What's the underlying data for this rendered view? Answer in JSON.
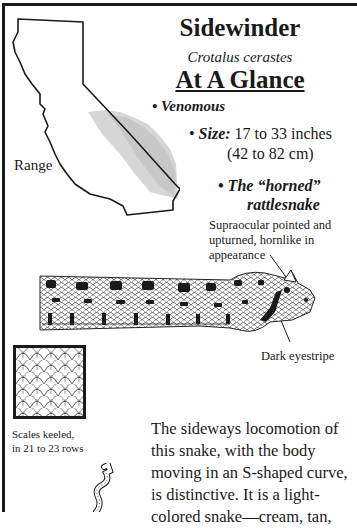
{
  "header": {
    "title": "Sidewinder",
    "scientific_name": "Crotalus cerastes",
    "section_title": "At A Glance"
  },
  "facts": {
    "venomous": "• Venomous",
    "size_bullet": "• ",
    "size_label": "Size:",
    "size_inches": " 17 to 33 inches",
    "size_cm": "(42 to 82 cm)",
    "horned_line1": "• The “horned”",
    "horned_line2": "rattlesnake"
  },
  "map": {
    "label": "Range",
    "icon": "california-range-map",
    "range_color": "#c8c8c8"
  },
  "illustration": {
    "icon": "sidewinder-head-illustration",
    "supraocular_note": "Supraocular pointed and upturned, hornlike in appearance",
    "eyestripe_note": "Dark eyestripe"
  },
  "scales": {
    "icon": "keeled-scales-detail",
    "caption_line1": "Scales keeled,",
    "caption_line2": "in 21 to 23 rows"
  },
  "locomotion": {
    "icon": "s-curve-snake-icon",
    "description": "The sideways locomotion of this snake, with the body moving in an S-shaped curve, is distinctive. It is a light-colored snake—cream, tan,"
  }
}
